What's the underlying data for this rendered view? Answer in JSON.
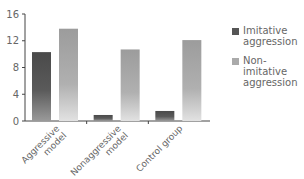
{
  "chart_data": {
    "type": "bar",
    "title": "",
    "xlabel": "",
    "ylabel": "",
    "categories": [
      "Aggressive model",
      "Nonaggressive model",
      "Control group"
    ],
    "series": [
      {
        "name": "Imitative aggression",
        "values": [
          10.3,
          0.9,
          1.5
        ],
        "color": "#5a5a5a"
      },
      {
        "name": "Non-imitative aggression",
        "values": [
          13.8,
          10.7,
          12.1
        ],
        "color": "#a8a8a8"
      }
    ],
    "ylim": [
      0,
      16
    ],
    "yticks": [
      0,
      4,
      8,
      12,
      16
    ],
    "grid": false,
    "legend_position": "right"
  },
  "axis": {
    "yticks": [
      "0",
      "4",
      "8",
      "12",
      "16"
    ],
    "categories": [
      [
        "Aggressive",
        "model"
      ],
      [
        "Nonaggressive",
        "model"
      ],
      [
        "Control group"
      ]
    ]
  },
  "legend": {
    "items": [
      {
        "label_line1": "Imitative",
        "label_line2": "aggression",
        "color": "#5a5a5a"
      },
      {
        "label_line1": "Non-imitative",
        "label_line2": "aggression",
        "color": "#a8a8a8"
      }
    ]
  }
}
